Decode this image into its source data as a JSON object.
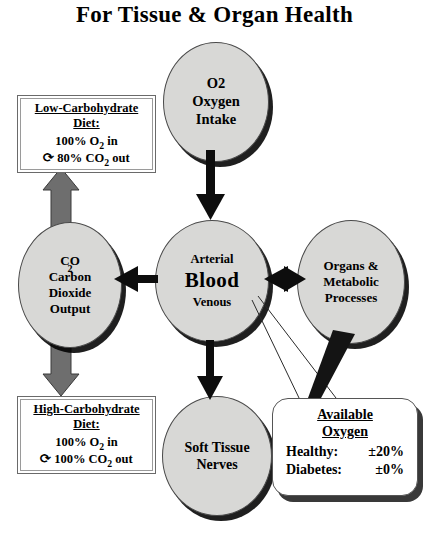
{
  "title": "For Tissue & Organ Health",
  "nodes": {
    "oxygen_intake": {
      "line1": "O2",
      "line2": "Oxygen",
      "line3": "Intake"
    },
    "blood": {
      "line1": "Arterial",
      "line2": "Blood",
      "line3": "Venous"
    },
    "co2_output": {
      "line1": "CO",
      "line1_sub": "2",
      "line2": "Carbon",
      "line3": "Dioxide",
      "line4": "Output"
    },
    "organs": {
      "line1": "Organs &",
      "line2": "Metabolic",
      "line3": "Processes"
    },
    "soft_tissue": {
      "line1": "Soft Tissue",
      "line2": "Nerves"
    }
  },
  "low_carb_box": {
    "title_line1": "Low-Carbohydrate",
    "title_line2": "Diet:",
    "line_in": "100% O",
    "line_in_sub": "2",
    "line_in_tail": " in",
    "arrow_glyph": "⟳",
    "line_out": "80% CO",
    "line_out_sub": "2",
    "line_out_tail": " out"
  },
  "high_carb_box": {
    "title_line1": "High-Carbohydrate",
    "title_line2": "Diet:",
    "line_in": "100% O",
    "line_in_sub": "2",
    "line_in_tail": " in",
    "arrow_glyph": "⟳",
    "line_out": "100% CO",
    "line_out_sub": "2",
    "line_out_tail": " out"
  },
  "available_oxygen_box": {
    "title_line1": "Available",
    "title_line2": "Oxygen",
    "rows": [
      {
        "label": "Healthy:",
        "value": "±20%"
      },
      {
        "label": "Diabetes:",
        "value": "±0%"
      }
    ]
  },
  "colors": {
    "oval_fill": "#d8d8d6",
    "oval_stroke": "#4a4a4a",
    "shadow": "#000000",
    "black_arrow": "#0d0d0d",
    "gray_arrow": "#6e6e6e",
    "box_fill": "#ffffff",
    "background": "#ffffff"
  },
  "connectors": [
    {
      "name": "oxygen-to-blood",
      "from": "oxygen_intake",
      "to": "blood",
      "style": "black-arrow",
      "direction": "down"
    },
    {
      "name": "blood-to-co2",
      "from": "blood",
      "to": "co2_output",
      "style": "black-arrow",
      "direction": "left"
    },
    {
      "name": "blood-to-organs",
      "from": "blood",
      "to": "organs",
      "style": "black-arrow",
      "direction": "both"
    },
    {
      "name": "blood-to-soft-tissue",
      "from": "blood",
      "to": "soft_tissue",
      "style": "black-arrow",
      "direction": "down"
    },
    {
      "name": "co2-to-low-carb",
      "from": "co2_output",
      "to": "low_carb_box",
      "style": "gray-arrow",
      "direction": "up"
    },
    {
      "name": "co2-to-high-carb",
      "from": "co2_output",
      "to": "high_carb_box",
      "style": "gray-arrow",
      "direction": "down"
    },
    {
      "name": "organs-to-available-oxygen",
      "from": "organs",
      "to": "available_oxygen_box",
      "style": "black-wedge",
      "direction": "down"
    },
    {
      "name": "blood-callout-to-available-oxygen",
      "from": "blood",
      "to": "available_oxygen_box",
      "style": "thin-leader-lines",
      "direction": "down-right"
    }
  ]
}
